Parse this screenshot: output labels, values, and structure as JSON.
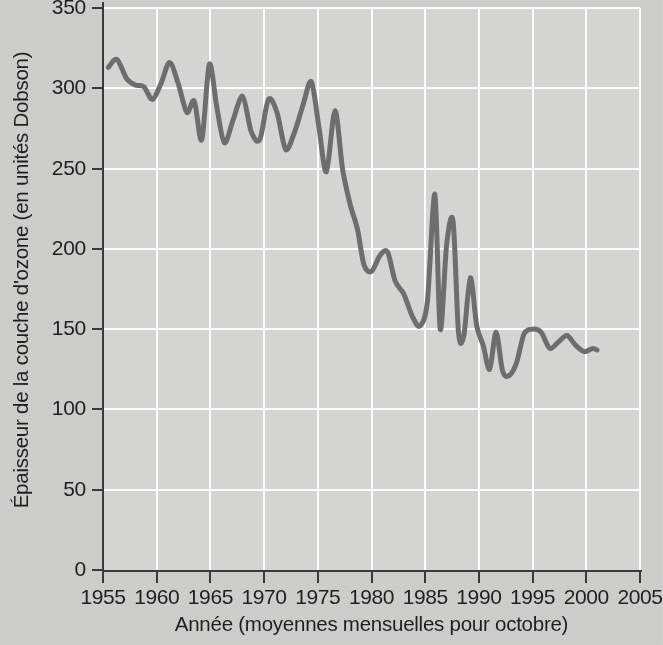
{
  "chart_data": {
    "type": "line",
    "title": "",
    "subtitle": "",
    "xlabel": "Année (moyennes mensuelles pour octobre)",
    "ylabel": "Épaisseur de la couche d'ozone (en unités Dobson)",
    "xlim": [
      1955,
      2005
    ],
    "ylim": [
      0,
      350
    ],
    "xticks": [
      1955,
      1960,
      1965,
      1970,
      1975,
      1980,
      1985,
      1990,
      1995,
      2000,
      2005
    ],
    "yticks": [
      0,
      50,
      100,
      150,
      200,
      250,
      300,
      350
    ],
    "xtick_labels": [
      "1955",
      "1960",
      "1965",
      "1970",
      "1975",
      "1980",
      "1985",
      "1990",
      "1995",
      "2000",
      "2005"
    ],
    "ytick_labels": [
      "0",
      "50",
      "100",
      "150",
      "200",
      "250",
      "300",
      "350"
    ],
    "grid": true,
    "grid_color": "#fdfdfd",
    "legend": null,
    "legend_position": "none",
    "annotations": [],
    "series": [
      {
        "name": "Épaisseur de la couche d'ozone",
        "color": "#6e6e6e",
        "line_width": 5,
        "units": "unités Dobson",
        "x": [
          1955.5,
          1956.3,
          1957.2,
          1958.0,
          1958.8,
          1959.6,
          1960.4,
          1961.2,
          1962.0,
          1962.8,
          1963.5,
          1964.2,
          1964.9,
          1965.6,
          1966.3,
          1967.1,
          1968.0,
          1968.8,
          1969.6,
          1970.4,
          1971.2,
          1972.0,
          1972.8,
          1973.6,
          1974.4,
          1975.1,
          1975.8,
          1976.6,
          1977.3,
          1978.0,
          1978.7,
          1979.3,
          1980.0,
          1980.8,
          1981.5,
          1982.2,
          1983.0,
          1983.8,
          1984.5,
          1985.2,
          1985.9,
          1986.4,
          1987.0,
          1987.6,
          1988.1,
          1988.6,
          1989.2,
          1989.8,
          1990.4,
          1991.0,
          1991.6,
          1992.2,
          1992.8,
          1993.5,
          1994.2,
          1995.0,
          1995.8,
          1996.6,
          1997.4,
          1998.2,
          1999.0,
          1999.8,
          2000.6,
          2001.0
        ],
        "y": [
          313,
          318,
          306,
          302,
          301,
          293,
          303,
          316,
          303,
          285,
          292,
          268,
          315,
          288,
          266,
          280,
          295,
          273,
          268,
          293,
          285,
          262,
          272,
          289,
          304,
          276,
          248,
          286,
          250,
          228,
          212,
          190,
          186,
          196,
          198,
          180,
          172,
          158,
          152,
          167,
          234,
          150,
          203,
          217,
          148,
          146,
          182,
          152,
          140,
          125,
          148,
          124,
          121,
          129,
          147,
          150,
          148,
          138,
          142,
          146,
          140,
          136,
          138,
          137
        ]
      }
    ]
  },
  "axes": {
    "y_title": "Épaisseur de la couche d'ozone (en unités Dobson)",
    "x_title": "Année (moyennes mensuelles pour octobre)"
  },
  "colors": {
    "figure_background": "#cecece",
    "plot_background": "#d6d6d5",
    "grid": "#fdfdfd",
    "axis": "#3a3a3a",
    "series": "#6e6e6e",
    "text": "#1f1f1f"
  }
}
